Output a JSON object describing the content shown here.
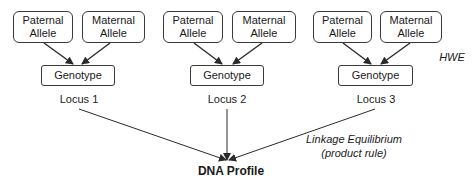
{
  "loci": [
    {
      "name": "Locus 1",
      "paternal": "Paternal Allele",
      "maternal": "Maternal Allele",
      "genotype": "Genotype",
      "paternal_lines": [
        "Paternal",
        "Allele"
      ],
      "maternal_lines": [
        "Maternal",
        "Allele"
      ]
    },
    {
      "name": "Locus 2",
      "paternal": "Paternal Allele",
      "maternal": "Maternal Allele",
      "genotype": "Genotype",
      "paternal_lines": [
        "Paternal",
        "Allele"
      ],
      "maternal_lines": [
        "Maternal",
        "Allele"
      ]
    },
    {
      "name": "Locus 3",
      "paternal": "Paternal Allele",
      "maternal": "Maternal Allele",
      "genotype": "Genotype",
      "paternal_lines": [
        "Paternal",
        "Allele"
      ],
      "maternal_lines": [
        "Maternal",
        "Allele"
      ]
    }
  ],
  "annotations": {
    "hwe": "HWE",
    "linkage_line1": "Linkage Equilibrium",
    "linkage_line2": "(product rule)"
  },
  "result": {
    "label": "DNA Profile"
  },
  "colors": {
    "stroke": "#2a2a2a",
    "text": "#1a1a1a",
    "background": "#ffffff"
  }
}
